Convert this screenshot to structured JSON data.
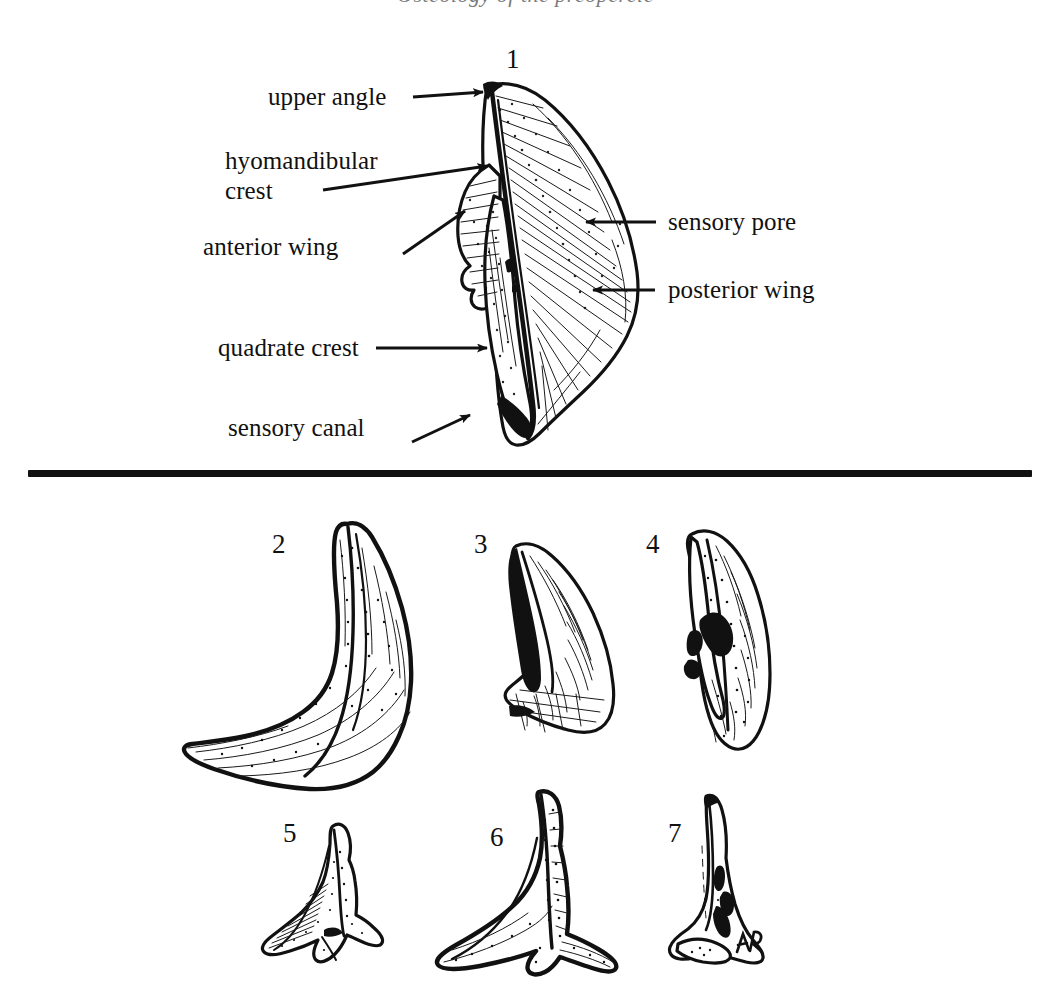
{
  "plate": {
    "cut_header_text": "Osteology of the preopercle",
    "divider": {
      "color": "#111111"
    },
    "figure_numbers": {
      "fig1": "1",
      "fig2": "2",
      "fig3": "3",
      "fig4": "4",
      "fig5": "5",
      "fig6": "6",
      "fig7": "7"
    },
    "signature": "AR"
  },
  "annotations": {
    "left": [
      {
        "key": "upper-angle",
        "text": "upper angle"
      },
      {
        "key": "hyomandibular-crest",
        "text": "hyomandibular\ncrest"
      },
      {
        "key": "anterior-wing",
        "text": "anterior wing"
      },
      {
        "key": "quadrate-crest",
        "text": "quadrate crest"
      },
      {
        "key": "sensory-canal",
        "text": "sensory canal"
      }
    ],
    "right": [
      {
        "key": "sensory-pore",
        "text": "sensory pore"
      },
      {
        "key": "posterior-wing",
        "text": "posterior wing"
      }
    ]
  },
  "colors": {
    "ink": "#111111",
    "paper": "#ffffff",
    "faded_text": "#7a7a7a"
  }
}
